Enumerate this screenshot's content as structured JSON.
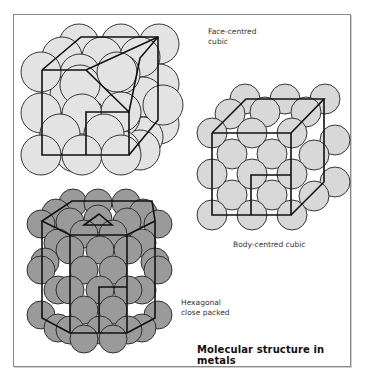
{
  "title": "Molecular structure in metals",
  "structures": [
    {
      "id": "fcc",
      "label_line1": "Face-centred",
      "label_line2": "cubic",
      "sphere_color": "#e3e3e3"
    },
    {
      "id": "bcc",
      "label": "Body-centred cubic",
      "sphere_color": "#d8d8d8"
    },
    {
      "id": "hcp",
      "label_line1": "Hexagonal",
      "label_line2": "close packed",
      "sphere_color": "#9a9a9a"
    }
  ],
  "colors": {
    "outline": "#1a1a1a",
    "frame": "#8a8a8a",
    "background": "#ffffff"
  }
}
